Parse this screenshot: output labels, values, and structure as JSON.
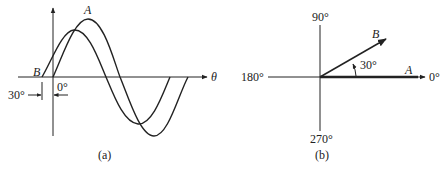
{
  "figure_a": {
    "caption": "(a)",
    "axis_label": "θ",
    "wave_a_label": "A",
    "wave_b_label": "B",
    "origin_label": "0°",
    "phase_shift_label": "30°"
  },
  "figure_b": {
    "caption": "(b)",
    "angle_labels": {
      "top": "90°",
      "left": "180°",
      "right": "0°",
      "bottom": "270°"
    },
    "phasor_a_label": "A",
    "phasor_b_label": "B",
    "angle_between_label": "30°"
  },
  "colors": {
    "line": "#222222",
    "background": "#ffffff"
  }
}
